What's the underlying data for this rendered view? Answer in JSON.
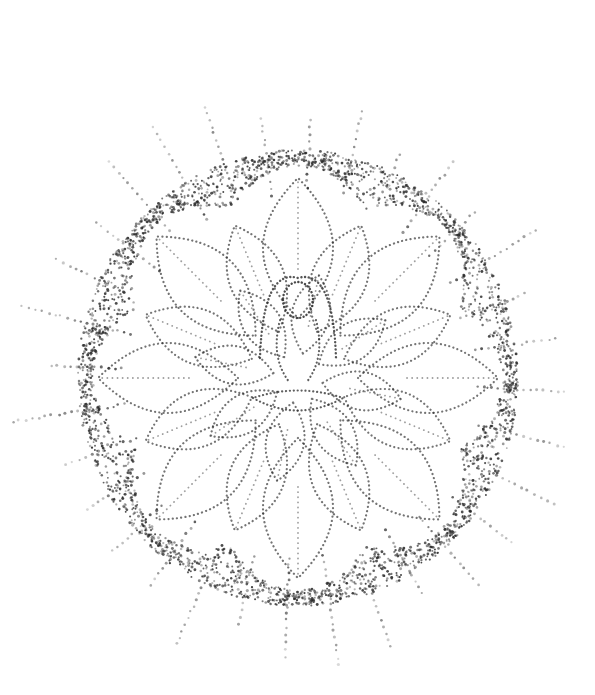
{
  "artwork": {
    "title": "Stippled lotus mandala with meditating figure",
    "style": "dotwork stipple",
    "ink_color": "#2a2a2a",
    "paper_color": "#ffffff",
    "center": [
      298,
      378
    ],
    "ring_radius": [
      220,
      228
    ],
    "ray_count": 32,
    "petal_layers": 3,
    "outer_petals": 8,
    "middle_petals": 8,
    "inner_petals": 8
  }
}
